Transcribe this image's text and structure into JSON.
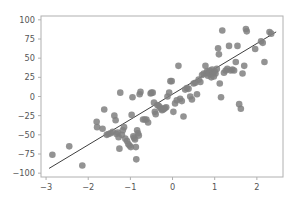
{
  "figure": {
    "width": 299,
    "height": 204,
    "background": "#ffffff"
  },
  "axes": {
    "left": 41,
    "top": 16,
    "right": 283,
    "bottom": 177,
    "spine_color": "#b0b0b0",
    "tick_color": "#b0b0b0",
    "tick_label_color": "#555555"
  },
  "chart_data": {
    "type": "scatter",
    "title": "",
    "xlabel": "",
    "ylabel": "",
    "xlim": [
      -3.12,
      2.62
    ],
    "ylim": [
      -105,
      105
    ],
    "xticks": [
      -3,
      -2,
      -1,
      0,
      1,
      2
    ],
    "xtick_labels": [
      "−3",
      "−2",
      "−1",
      "0",
      "1",
      "2"
    ],
    "yticks": [
      -100,
      -75,
      -50,
      -25,
      0,
      25,
      50,
      75,
      100
    ],
    "ytick_labels": [
      "−100",
      "−75",
      "−50",
      "−25",
      "0",
      "25",
      "50",
      "75",
      "100"
    ],
    "grid": false,
    "legend": null,
    "marker": {
      "shape": "circle",
      "color": "#808080",
      "size_px": 3.3,
      "alpha": 0.85
    },
    "fit_line": {
      "color": "#3f3f3f",
      "width": 1,
      "x_start": -2.92,
      "y_start": -93.5,
      "x_end": 2.45,
      "y_end": 84.0,
      "slope": 33.05,
      "intercept": -7.0
    },
    "series": [
      {
        "name": "samples",
        "points": [
          [
            -2.85,
            -76.0
          ],
          [
            -2.45,
            -65.0
          ],
          [
            -2.14,
            -90.0
          ],
          [
            -1.8,
            -33.0
          ],
          [
            -1.79,
            -40.0
          ],
          [
            -1.66,
            -42.0
          ],
          [
            -1.62,
            -17.0
          ],
          [
            -1.56,
            -50.0
          ],
          [
            -1.52,
            -49.0
          ],
          [
            -1.47,
            -48.0
          ],
          [
            -1.42,
            -46.0
          ],
          [
            -1.38,
            -25.0
          ],
          [
            -1.35,
            -31.0
          ],
          [
            -1.33,
            -49.0
          ],
          [
            -1.3,
            -47.0
          ],
          [
            -1.28,
            -53.0
          ],
          [
            -1.26,
            -68.0
          ],
          [
            -1.24,
            5.0
          ],
          [
            -1.2,
            -50.0
          ],
          [
            -1.18,
            -44.0
          ],
          [
            -1.15,
            -40.0
          ],
          [
            -1.12,
            -55.0
          ],
          [
            -1.08,
            -58.0
          ],
          [
            -1.05,
            -62.0
          ],
          [
            -1.02,
            -64.0
          ],
          [
            -0.99,
            -66.0
          ],
          [
            -0.97,
            -24.0
          ],
          [
            -0.95,
            -1.0
          ],
          [
            -0.93,
            -52.0
          ],
          [
            -0.91,
            -54.0
          ],
          [
            -0.89,
            -56.0
          ],
          [
            -0.87,
            -66.0
          ],
          [
            -0.86,
            -82.0
          ],
          [
            -0.84,
            -44.0
          ],
          [
            -0.82,
            -48.0
          ],
          [
            -0.8,
            -51.0
          ],
          [
            -0.78,
            3.0
          ],
          [
            -0.76,
            6.0
          ],
          [
            -0.7,
            -30.0
          ],
          [
            -0.66,
            -30.0
          ],
          [
            -0.62,
            -30.0
          ],
          [
            -0.58,
            -34.0
          ],
          [
            -0.52,
            4.0
          ],
          [
            -0.5,
            5.0
          ],
          [
            -0.47,
            5.0
          ],
          [
            -0.44,
            -8.0
          ],
          [
            -0.42,
            -20.0
          ],
          [
            -0.4,
            -23.0
          ],
          [
            -0.36,
            -11.0
          ],
          [
            -0.33,
            -12.0
          ],
          [
            -0.3,
            -14.0
          ],
          [
            -0.27,
            -16.0
          ],
          [
            -0.25,
            -18.0
          ],
          [
            -0.22,
            -17.0
          ],
          [
            -0.2,
            -16.0
          ],
          [
            -0.18,
            -15.0
          ],
          [
            -0.15,
            -14.0
          ],
          [
            -0.12,
            0.0
          ],
          [
            -0.08,
            5.0
          ],
          [
            -0.05,
            20.0
          ],
          [
            -0.02,
            20.0
          ],
          [
            0.02,
            -20.0
          ],
          [
            0.06,
            -9.0
          ],
          [
            0.1,
            -5.0
          ],
          [
            0.14,
            40.0
          ],
          [
            0.18,
            -3.0
          ],
          [
            0.22,
            -6.0
          ],
          [
            0.26,
            -26.0
          ],
          [
            0.3,
            9.0
          ],
          [
            0.34,
            11.0
          ],
          [
            0.38,
            10.0
          ],
          [
            0.42,
            0.0
          ],
          [
            0.46,
            -4.0
          ],
          [
            0.5,
            17.0
          ],
          [
            0.54,
            18.0
          ],
          [
            0.58,
            3.0
          ],
          [
            0.62,
            22.0
          ],
          [
            0.66,
            19.0
          ],
          [
            0.7,
            28.0
          ],
          [
            0.74,
            30.0
          ],
          [
            0.78,
            40.0
          ],
          [
            0.8,
            30.0
          ],
          [
            0.82,
            33.0
          ],
          [
            0.84,
            27.0
          ],
          [
            0.86,
            31.0
          ],
          [
            0.88,
            34.0
          ],
          [
            0.9,
            29.0
          ],
          [
            0.92,
            25.0
          ],
          [
            0.94,
            35.0
          ],
          [
            0.96,
            31.0
          ],
          [
            0.98,
            26.0
          ],
          [
            1.0,
            33.0
          ],
          [
            1.02,
            30.0
          ],
          [
            1.05,
            36.0
          ],
          [
            1.08,
            63.0
          ],
          [
            1.1,
            55.0
          ],
          [
            1.12,
            17.0
          ],
          [
            1.15,
            -1.0
          ],
          [
            1.18,
            86.0
          ],
          [
            1.22,
            31.0
          ],
          [
            1.26,
            34.0
          ],
          [
            1.3,
            36.0
          ],
          [
            1.34,
            66.0
          ],
          [
            1.38,
            34.0
          ],
          [
            1.42,
            35.0
          ],
          [
            1.46,
            34.0
          ],
          [
            1.5,
            45.0
          ],
          [
            1.54,
            66.0
          ],
          [
            1.58,
            -10.0
          ],
          [
            1.62,
            -16.0
          ],
          [
            1.66,
            30.0
          ],
          [
            1.7,
            40.0
          ],
          [
            1.74,
            88.0
          ],
          [
            1.76,
            85.0
          ],
          [
            1.96,
            62.0
          ],
          [
            2.1,
            72.0
          ],
          [
            2.14,
            70.0
          ],
          [
            2.18,
            45.0
          ],
          [
            2.3,
            84.0
          ],
          [
            2.34,
            82.0
          ]
        ]
      }
    ]
  }
}
